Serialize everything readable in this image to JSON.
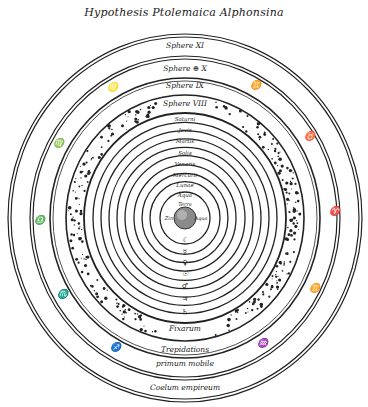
{
  "title": "Hypothesis Ptolemaica Alphonsina",
  "outer_spheres": [
    {
      "label": "Sphere XI",
      "y": 48
    },
    {
      "label": "Sphere ⊕ X",
      "y": 71
    },
    {
      "label": "Sphere IX",
      "y": 88
    },
    {
      "label": "Sphere VIII",
      "y": 106
    }
  ],
  "planet_spheres": [
    {
      "label": "Saturni",
      "y": 121,
      "symbol": "♄",
      "sy": 314
    },
    {
      "label": "Jovis",
      "y": 132,
      "symbol": "♃",
      "sy": 301
    },
    {
      "label": "Martis",
      "y": 143,
      "symbol": "♂",
      "sy": 288
    },
    {
      "label": "Solis",
      "y": 155,
      "symbol": "☉",
      "sy": 276
    },
    {
      "label": "Veneris",
      "y": 166,
      "symbol": "♀",
      "sy": 265
    },
    {
      "label": "Mercurii",
      "y": 177,
      "symbol": "☿",
      "sy": 254
    },
    {
      "label": "Lunae",
      "y": 187,
      "symbol": "☾",
      "sy": 242
    },
    {
      "label": "Aqua",
      "y": 197
    }
  ],
  "center": {
    "label_top": "Terra",
    "label_left": "Zin",
    "label_right": "Aqua"
  },
  "bottom_labels": [
    {
      "label": "Fixarum",
      "y": 331
    },
    {
      "label": "Trepidations",
      "y": 352
    },
    {
      "label": "primum mobile",
      "y": 366
    },
    {
      "label": "Coelum empireum",
      "y": 390
    }
  ],
  "zodiac": [
    {
      "symbol": "♊",
      "name": "gemini",
      "x": 255,
      "y": 88
    },
    {
      "symbol": "♌",
      "name": "leo",
      "x": 112,
      "y": 90
    },
    {
      "symbol": "♍",
      "name": "virgo",
      "x": 58,
      "y": 146
    },
    {
      "symbol": "♎",
      "name": "libra",
      "x": 39,
      "y": 223
    },
    {
      "symbol": "♏",
      "name": "scorpio",
      "x": 62,
      "y": 297
    },
    {
      "symbol": "♐",
      "name": "sagittarius",
      "x": 115,
      "y": 350
    },
    {
      "symbol": "♈",
      "name": "aries",
      "x": 334,
      "y": 214
    },
    {
      "symbol": "♉",
      "name": "taurus",
      "x": 309,
      "y": 139
    },
    {
      "symbol": "♊",
      "name": "gemini-2",
      "x": 314,
      "y": 291
    },
    {
      "symbol": "♒",
      "name": "aquarius",
      "x": 262,
      "y": 346
    }
  ]
}
